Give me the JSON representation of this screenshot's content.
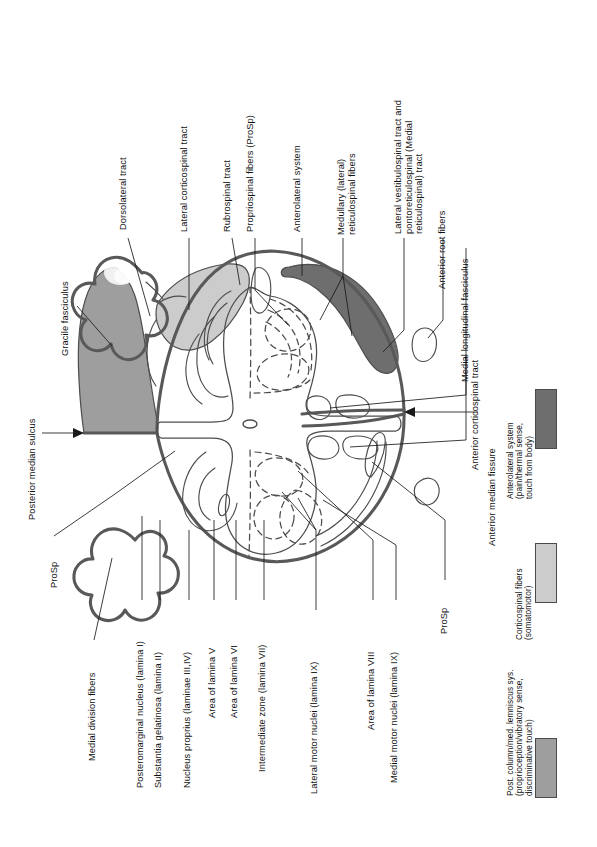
{
  "figure": {
    "type": "anatomical-cross-section",
    "orientation": "rotated 90 degrees (labels read bottom-to-top)"
  },
  "colors": {
    "posterior_column_gray": "#9e9e9e",
    "corticospinal_light_gray": "#cccccc",
    "anterolateral_dark_gray": "#6e6e6e",
    "outline": "#595959",
    "leader": "#1a1a1a",
    "text": "#111111",
    "background": "#ffffff"
  },
  "labels": {
    "dorsolateral_tract": "Dorsolateral tract",
    "lateral_corticospinal_tract": "Lateral corticospinal tract",
    "rubrospinal_tract": "Rubrospinal tract",
    "propriospinal_fibers": "Propriospinal fibers (ProSp)",
    "anterolateral_system": "Anterolateral system",
    "medullary_reticulospinal": "Medullary (lateral)\nreticulospinal fibers",
    "lateral_vestibulospinal": "Lateral vestibulospinal tract and\npontoreticulospinal (Medial\nreticulospinal) tract",
    "anterior_root_fibers": "Anterior root fibers",
    "medial_longitudinal_fasciculus": "Medial longitudinal fasciculus",
    "anterior_corticospinal_tract": "Anterior corticospinal tract",
    "anterior_median_fissure": "Anterior median fissure",
    "gracile_fasciculus": "Gracile fasciculus",
    "posterior_median_sulcus": "Posterior median sulcus",
    "prosp_left": "ProSp",
    "prosp_right": "ProSp",
    "medial_division_fibers": "Medial division fibers",
    "posteromarginal_nucleus": "Posteromarginal nucleus (lamina I)",
    "substantia_gelatinosa": "Substantia gelatinosa (lamina II)",
    "nucleus_proprius": "Nucleus proprius (laminae III,IV)",
    "area_lamina_v": "Area of lamina V",
    "area_lamina_vi": "Area of lamina VI",
    "intermediate_zone": "Intermediate zone (lamina VII)",
    "lateral_motor_nuclei": "Lateral motor nuclei (lamina IX)",
    "area_lamina_viii": "Area of lamina VIII",
    "medial_motor_nuclei": "Medial motor nuclei (lamina IX)"
  },
  "legend": {
    "items": [
      {
        "key": "anterolateral",
        "color": "#6e6e6e",
        "text": "Anterolateral system\n(pain/thermal sense,\ntouch from body)"
      },
      {
        "key": "corticospinal",
        "color": "#cccccc",
        "text": "Corticospinal fibers\n(somatomotor)"
      },
      {
        "key": "posterior_column",
        "color": "#9e9e9e",
        "text": "Post. column/med. lemniscus sys.\n(proprioception/vibratory sense,\ndiscriminative touch)"
      }
    ]
  }
}
